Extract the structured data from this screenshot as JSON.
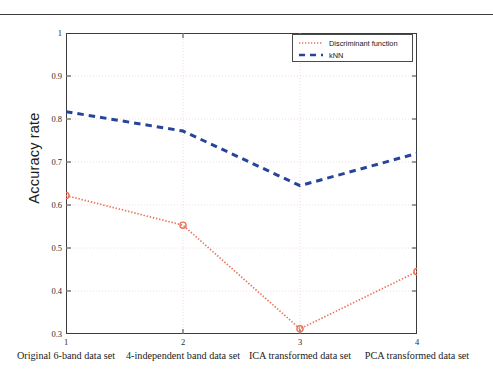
{
  "figure": {
    "ylabel": "Accuracy rate",
    "ytick_labels": [
      "1",
      "0.9",
      "0.8",
      "0.7",
      "0.6",
      "0.5",
      "0.4",
      "0.3"
    ],
    "xtick_labels": [
      "1",
      "2",
      "3",
      "4"
    ],
    "captions": [
      "Original 6-band data set",
      "4-independent band data set",
      "ICA transformed data set",
      "PCA transformed data set"
    ],
    "legend": {
      "items": [
        {
          "label": "Discriminant function",
          "style": "dotted",
          "color": "#e8735a"
        },
        {
          "label": "kNN",
          "style": "dashed",
          "color": "#27449a"
        }
      ]
    },
    "colors": {
      "discriminant": "#e8735a",
      "knn": "#27449a",
      "axis": "#3c3c3c",
      "grid": "#f0d8d0",
      "background": "#ffffff"
    }
  },
  "chart_data": {
    "type": "line",
    "title": "",
    "xlabel": "",
    "ylabel": "Accuracy rate",
    "x": [
      1,
      2,
      3,
      4
    ],
    "categories": [
      "Original 6-band data set",
      "4-independent band data set",
      "ICA transformed data set",
      "PCA transformed data set"
    ],
    "xlim": [
      1,
      4
    ],
    "ylim": [
      0.3,
      1
    ],
    "yticks": [
      0.3,
      0.4,
      0.5,
      0.6,
      0.7,
      0.8,
      0.9,
      1
    ],
    "xticks": [
      1,
      2,
      3,
      4
    ],
    "grid": true,
    "legend_position": "upper right",
    "series": [
      {
        "name": "Discriminant function",
        "values": [
          0.622,
          0.553,
          0.312,
          0.445
        ],
        "color": "#e8735a",
        "linestyle": "dotted",
        "marker": "o"
      },
      {
        "name": "kNN",
        "values": [
          0.817,
          0.772,
          0.645,
          0.72
        ],
        "color": "#27449a",
        "linestyle": "dashed",
        "marker": "none"
      }
    ]
  }
}
